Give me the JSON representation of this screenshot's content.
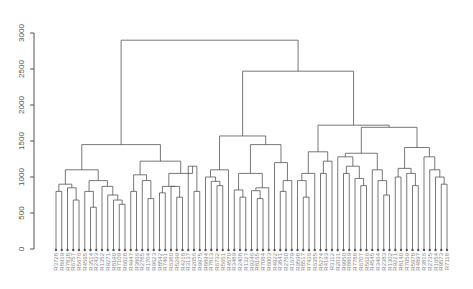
{
  "chart_data": {
    "type": "dendrogram",
    "title": "",
    "xlabel": "",
    "ylabel": "",
    "ylim": [
      0,
      3000
    ],
    "yticks": [
      0,
      500,
      1000,
      1500,
      2000,
      2500,
      3000
    ],
    "leaf_count": 90,
    "first_leaf_label": "R3728",
    "last_leaf_label": "R7118",
    "line_color": "#555555",
    "label_color": "#888888",
    "tree": {
      "h": 2900,
      "c": [
        {
          "h": 1450,
          "c": [
            {
              "h": 1100,
              "c": [
                {
                  "h": 900,
                  "c": [
                    {
                      "h": 800,
                      "c": [
                        "L",
                        "L"
                      ]
                    },
                    {
                      "h": 850,
                      "c": [
                        "L",
                        {
                          "h": 680,
                          "c": [
                            "L",
                            "L"
                          ]
                        }
                      ]
                    }
                  ]
                },
                {
                  "h": 950,
                  "c": [
                    {
                      "h": 800,
                      "c": [
                        "L",
                        {
                          "h": 580,
                          "c": [
                            "L",
                            "L"
                          ]
                        }
                      ]
                    },
                    {
                      "h": 870,
                      "c": [
                        "L",
                        {
                          "h": 750,
                          "c": [
                            "L",
                            {
                              "h": 680,
                              "c": [
                                "L",
                                {
                                  "h": 620,
                                  "c": [
                                    "L",
                                    "L"
                                  ]
                                }
                              ]
                            }
                          ]
                        }
                      ]
                    }
                  ]
                }
              ]
            },
            {
              "h": 1220,
              "c": [
                {
                  "h": 1030,
                  "c": [
                    {
                      "h": 800,
                      "c": [
                        "L",
                        "L"
                      ]
                    },
                    {
                      "h": 950,
                      "c": [
                        "L",
                        {
                          "h": 700,
                          "c": [
                            "L",
                            "L"
                          ]
                        }
                      ]
                    }
                  ]
                },
                {
                  "h": 1050,
                  "c": [
                    {
                      "h": 870,
                      "c": [
                        {
                          "h": 780,
                          "c": [
                            "L",
                            "L"
                          ]
                        },
                        {
                          "h": 870,
                          "c": [
                            "L",
                            {
                              "h": 720,
                              "c": [
                                "L",
                                "L"
                              ]
                            }
                          ]
                        }
                      ]
                    },
                    {
                      "h": 1150,
                      "c": [
                        "L",
                        {
                          "h": 800,
                          "c": [
                            "L",
                            "L"
                          ]
                        }
                      ]
                    }
                  ]
                }
              ]
            }
          ]
        },
        {
          "h": 2470,
          "c": [
            {
              "h": 1570,
              "c": [
                {
                  "h": 1100,
                  "c": [
                    {
                      "h": 1000,
                      "c": [
                        "L",
                        {
                          "h": 940,
                          "c": [
                            "L",
                            {
                              "h": 880,
                              "c": [
                                "L",
                                "L"
                              ]
                            }
                          ]
                        }
                      ]
                    },
                    "L"
                  ]
                },
                {
                  "h": 1450,
                  "c": [
                    {
                      "h": 1050,
                      "c": [
                        {
                          "h": 820,
                          "c": [
                            "L",
                            {
                              "h": 720,
                              "c": [
                                "L",
                                "L"
                              ]
                            }
                          ]
                        },
                        {
                          "h": 850,
                          "c": [
                            {
                              "h": 810,
                              "c": [
                                "L",
                                {
                                  "h": 700,
                                  "c": [
                                    "L",
                                    "L"
                                  ]
                                }
                              ]
                            },
                            "L"
                          ]
                        }
                      ]
                    },
                    {
                      "h": 1200,
                      "c": [
                        "L",
                        {
                          "h": 950,
                          "c": [
                            {
                              "h": 800,
                              "c": [
                                "L",
                                "L"
                              ]
                            },
                            "L"
                          ]
                        }
                      ]
                    }
                  ]
                }
              ]
            },
            {
              "h": 1720,
              "c": [
                {
                  "h": 1350,
                  "c": [
                    {
                      "h": 1050,
                      "c": [
                        {
                          "h": 950,
                          "c": [
                            "L",
                            {
                              "h": 720,
                              "c": [
                                "L",
                                "L"
                              ]
                            }
                          ]
                        },
                        "L"
                      ]
                    },
                    {
                      "h": 1220,
                      "c": [
                        {
                          "h": 1050,
                          "c": [
                            "L",
                            "L"
                          ]
                        },
                        "L"
                      ]
                    }
                  ]
                },
                {
                  "h": 1690,
                  "c": [
                    {
                      "h": 1330,
                      "c": [
                        {
                          "h": 1280,
                          "c": [
                            "L",
                            {
                              "h": 1150,
                              "c": [
                                {
                                  "h": 1050,
                                  "c": [
                                    "L",
                                    "L"
                                  ]
                                },
                                {
                                  "h": 980,
                                  "c": [
                                    "L",
                                    {
                                      "h": 880,
                                      "c": [
                                        "L",
                                        "L"
                                      ]
                                    }
                                  ]
                                }
                              ]
                            }
                          ]
                        },
                        {
                          "h": 1100,
                          "c": [
                            "L",
                            {
                              "h": 950,
                              "c": [
                                "L",
                                {
                                  "h": 750,
                                  "c": [
                                    "L",
                                    "L"
                                  ]
                                }
                              ]
                            }
                          ]
                        }
                      ]
                    },
                    {
                      "h": 1410,
                      "c": [
                        {
                          "h": 1120,
                          "c": [
                            {
                              "h": 1000,
                              "c": [
                                "L",
                                "L"
                              ]
                            },
                            {
                              "h": 1050,
                              "c": [
                                "L",
                                {
                                  "h": 880,
                                  "c": [
                                    "L",
                                    "L"
                                  ]
                                }
                              ]
                            }
                          ]
                        },
                        {
                          "h": 1280,
                          "c": [
                            "L",
                            {
                              "h": 1100,
                              "c": [
                                "L",
                                {
                                  "h": 1000,
                                  "c": [
                                    "L",
                                    {
                                      "h": 900,
                                      "c": [
                                        "L",
                                        "L"
                                      ]
                                    }
                                  ]
                                }
                              ]
                            }
                          ]
                        }
                      ]
                    }
                  ]
                }
              ]
            }
          ]
        }
      ]
    }
  }
}
